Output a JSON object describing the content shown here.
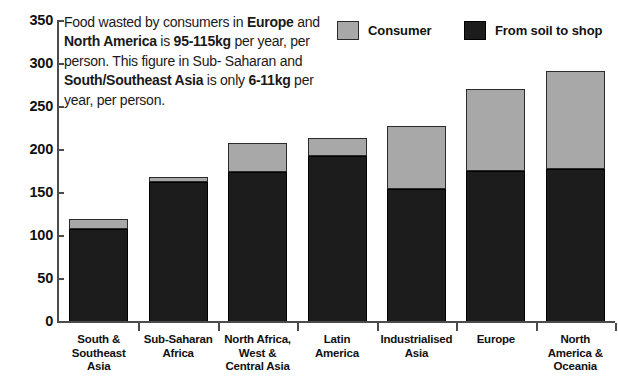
{
  "annotation": {
    "line1_pre": "Food wasted by consumers in ",
    "line1_bold": "Europe",
    "line2_pre": "and ",
    "line2_bold1": "North America",
    "line2_mid": " is ",
    "line2_bold2": "95-115kg",
    "line3": "per year, per person. This figure in Sub-",
    "line4_pre": "Saharan and ",
    "line4_bold": "South/Southeast Asia",
    "line5_pre": "is only ",
    "line5_bold": "6-11kg",
    "line5_post": " per year, per person.",
    "full_text": "Food wasted by consumers in Europe and North America is 95-115kg per year, per person. This figure in Sub-Saharan and South/Southeast Asia is only 6-11kg per year, per person."
  },
  "legend": {
    "consumer_label": "Consumer",
    "soil_label": "From soil to shop"
  },
  "colors": {
    "consumer": "#a8a8a8",
    "from_soil_to_shop": "#1c1c1c",
    "axis": "#4c4c4c",
    "text": "#1a1a1a",
    "background": "#ffffff"
  },
  "chart_data": {
    "type": "bar",
    "stacked": true,
    "title": "",
    "subtitle": "",
    "xlabel": "",
    "ylabel": "",
    "ylim": [
      0,
      350
    ],
    "yticks": [
      0,
      50,
      100,
      150,
      200,
      250,
      300,
      350
    ],
    "ytick_labels": [
      "0",
      "50",
      "100",
      "150",
      "200",
      "250",
      "300",
      "350"
    ],
    "grid": false,
    "legend_position": "top-right",
    "categories": [
      "South & Southeast Asia",
      "Sub-Saharan Africa",
      "North Africa, West & Central Asia",
      "Latin America",
      "Industrialised Asia",
      "Europe",
      "North America & Oceania"
    ],
    "category_lines": [
      [
        "South &",
        "Southeast",
        "Asia"
      ],
      [
        "Sub-Saharan",
        "Africa"
      ],
      [
        "North Africa,",
        "West &",
        "Central Asia"
      ],
      [
        "Latin",
        "America"
      ],
      [
        "Industrialised",
        "Asia"
      ],
      [
        "Europe"
      ],
      [
        "North",
        "America &",
        "Oceania"
      ]
    ],
    "series": [
      {
        "name": "From soil to shop",
        "color": "#1c1c1c",
        "values": [
          108,
          163,
          174,
          193,
          155,
          176,
          178
        ]
      },
      {
        "name": "Consumer",
        "color": "#a8a8a8",
        "values": [
          12,
          6,
          34,
          21,
          73,
          95,
          114
        ]
      }
    ],
    "totals": [
      120,
      169,
      208,
      214,
      228,
      271,
      292
    ]
  }
}
